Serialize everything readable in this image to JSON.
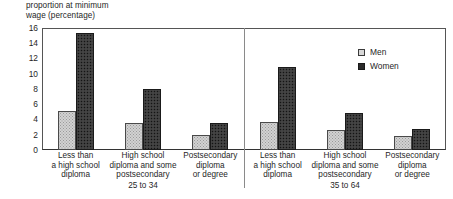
{
  "chart_data": {
    "type": "bar",
    "title": "proportion at minimum\nwage (percentage)",
    "xlabel": "",
    "ylabel": "proportion at minimum wage (percentage)",
    "ylim": [
      0,
      16
    ],
    "yticks": [
      0,
      2,
      4,
      6,
      8,
      10,
      12,
      14,
      16
    ],
    "grid": false,
    "legend_position": "top-right",
    "categories": [
      "Less than\na high school\ndiploma",
      "High school\ndiploma and some\npostsecondary",
      "Postsecondary\ndiploma\nor degree",
      "Less than\na high school\ndiploma",
      "High school\ndiploma and some\npostsecondary",
      "Postsecondary\ndiploma\nor degree"
    ],
    "groups": [
      {
        "label": "25 to 34",
        "categories": [
          0,
          1,
          2
        ]
      },
      {
        "label": "35 to 64",
        "categories": [
          3,
          4,
          5
        ]
      }
    ],
    "series": [
      {
        "name": "Men",
        "color": "#d2d2d2",
        "values": [
          5.1,
          3.6,
          2.0,
          3.7,
          2.6,
          1.9
        ]
      },
      {
        "name": "Women",
        "color": "#3b3b3b",
        "values": [
          15.3,
          8.0,
          3.5,
          10.9,
          4.8,
          2.8
        ]
      }
    ]
  },
  "legend": {
    "items": [
      {
        "label": "Men"
      },
      {
        "label": "Women"
      }
    ]
  }
}
